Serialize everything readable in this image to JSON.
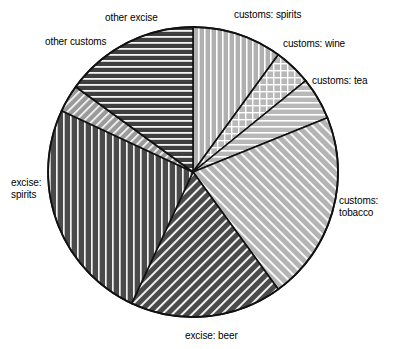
{
  "chart_data": {
    "type": "pie",
    "title": "",
    "subtitle": "",
    "xlabel": "",
    "ylabel": "",
    "legend_position": "none",
    "grid": false,
    "labels_outside": true,
    "start_angle_deg": 0,
    "direction": "clockwise",
    "categories": [
      "customs: spirits",
      "customs: wine",
      "customs: tea",
      "customs: tobacco",
      "excise: beer",
      "excise: spirits",
      "other customs",
      "other excise"
    ],
    "values": [
      10.0,
      4.2,
      4.7,
      21.1,
      17.0,
      25.0,
      3.1,
      14.9
    ],
    "units": "percent",
    "slices": [
      {
        "label": "customs: spirits",
        "value": 10.0,
        "start_deg": 0,
        "end_deg": 36,
        "fill": "#b0b0b0",
        "pattern": "vertical-lines",
        "label_x": 234,
        "label_y": 9
      },
      {
        "label": "customs: wine",
        "value": 4.2,
        "start_deg": 36,
        "end_deg": 51,
        "fill": "#b8b8b8",
        "pattern": "cross-hatch",
        "label_x": 283,
        "label_y": 38
      },
      {
        "label": "customs: tea",
        "value": 4.7,
        "start_deg": 51,
        "end_deg": 68,
        "fill": "#b8b8b8",
        "pattern": "horizontal-lines",
        "label_x": 312,
        "label_y": 75
      },
      {
        "label": "customs: tobacco",
        "value": 21.1,
        "start_deg": 68,
        "end_deg": 144,
        "fill": "#b4b4b4",
        "pattern": "diagonal-lines-45",
        "label_x": 339,
        "label_y": 195
      },
      {
        "label": "excise: beer",
        "value": 17.0,
        "start_deg": 144,
        "end_deg": 205,
        "fill": "#4a4a4a",
        "pattern": "diagonal-lines-135",
        "label_x": 185,
        "label_y": 330
      },
      {
        "label": "excise: spirits",
        "value": 25.0,
        "start_deg": 205,
        "end_deg": 295,
        "fill": "#4a4a4a",
        "pattern": "vertical-lines",
        "label_x": 11,
        "label_y": 177
      },
      {
        "label": "other customs",
        "value": 3.1,
        "start_deg": 295,
        "end_deg": 306,
        "fill": "#9a9a9a",
        "pattern": "diagonal-lines-135",
        "label_x": 45,
        "label_y": 36
      },
      {
        "label": "other excise",
        "value": 14.9,
        "start_deg": 306,
        "end_deg": 360,
        "fill": "#3f3f3f",
        "pattern": "horizontal-lines",
        "label_x": 105,
        "label_y": 12
      }
    ],
    "geometry": {
      "center_x": 193,
      "center_y": 172,
      "radius": 145
    },
    "colors": {
      "outline": "#111111",
      "background": "#ffffff",
      "text": "#000000"
    }
  },
  "labels": {
    "customs_spirits": "customs: spirits",
    "customs_wine": "customs: wine",
    "customs_tea": "customs: tea",
    "customs_tobacco_line1": "customs:",
    "customs_tobacco_line2": "tobacco",
    "excise_beer": "excise: beer",
    "excise_spirits_line1": "excise:",
    "excise_spirits_line2": "spirits",
    "other_customs": "other customs",
    "other_excise": "other excise"
  }
}
